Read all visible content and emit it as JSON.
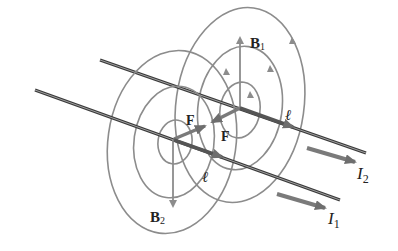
{
  "diagram": {
    "colors": {
      "field": "#8c8c8c",
      "wire": "#3a3a3a",
      "vector": "#7a7a7a",
      "text": "#222222"
    },
    "labels": {
      "b1": "B",
      "b1_sub": "1",
      "b2": "B",
      "b2_sub": "2",
      "f_left": "F",
      "f_right": "F",
      "ell_top": "ℓ",
      "ell_bottom": "ℓ",
      "i2": "I",
      "i2_sub": "2",
      "i1": "I",
      "i1_sub": "1"
    },
    "wires": [
      {
        "name": "wire-1",
        "current": "I1"
      },
      {
        "name": "wire-2",
        "current": "I2"
      }
    ]
  }
}
